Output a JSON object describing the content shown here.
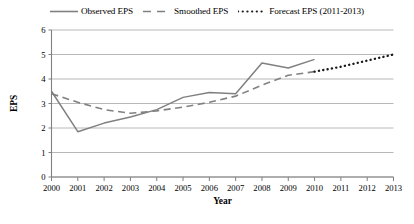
{
  "legend": {
    "entries": [
      {
        "label": "Observed EPS",
        "style": "solid",
        "color": "#808080",
        "icon": "solid-line-icon"
      },
      {
        "label": "Smoothed EPS",
        "style": "dashed",
        "color": "#808080",
        "icon": "dashed-line-icon"
      },
      {
        "label": "Forecast EPS (2011-2013)",
        "style": "dotted",
        "color": "#1a1a1a",
        "icon": "dotted-line-icon"
      }
    ]
  },
  "axes": {
    "y_title": "EPS",
    "x_title": "Year",
    "y_ticks": [
      "0",
      "1",
      "2",
      "3",
      "4",
      "5",
      "6"
    ],
    "x_ticks": [
      "2000",
      "2001",
      "2002",
      "2003",
      "2004",
      "2005",
      "2006",
      "2007",
      "2008",
      "2009",
      "2010",
      "2011",
      "2012",
      "2013"
    ]
  },
  "colors": {
    "observed": "#808080",
    "smoothed": "#808080",
    "forecast": "#1a1a1a",
    "grid": "#a6a6a6",
    "axis": "#808080",
    "background": "#ffffff"
  },
  "chart_data": {
    "type": "line",
    "title": "",
    "xlabel": "Year",
    "ylabel": "EPS",
    "xlim": [
      2000,
      2013
    ],
    "ylim": [
      0,
      6
    ],
    "ytick_step": 1,
    "grid": true,
    "legend_position": "top",
    "x": [
      2000,
      2001,
      2002,
      2003,
      2004,
      2005,
      2006,
      2007,
      2008,
      2009,
      2010,
      2011,
      2012,
      2013
    ],
    "series": [
      {
        "name": "Observed EPS",
        "style": "solid",
        "color": "#808080",
        "x": [
          2000,
          2001,
          2002,
          2003,
          2004,
          2005,
          2006,
          2007,
          2008,
          2009,
          2010
        ],
        "values": [
          3.5,
          1.85,
          2.2,
          2.45,
          2.75,
          3.25,
          3.45,
          3.4,
          4.65,
          4.45,
          4.8
        ]
      },
      {
        "name": "Smoothed EPS",
        "style": "dashed",
        "color": "#808080",
        "x": [
          2000,
          2001,
          2002,
          2003,
          2004,
          2005,
          2006,
          2007,
          2008,
          2009,
          2010
        ],
        "values": [
          3.4,
          3.05,
          2.75,
          2.6,
          2.7,
          2.85,
          3.05,
          3.3,
          3.75,
          4.15,
          4.3
        ]
      },
      {
        "name": "Forecast EPS (2011-2013)",
        "style": "dotted",
        "color": "#1a1a1a",
        "x": [
          2010,
          2011,
          2012,
          2013
        ],
        "values": [
          4.3,
          4.5,
          4.75,
          5.0
        ]
      }
    ]
  }
}
